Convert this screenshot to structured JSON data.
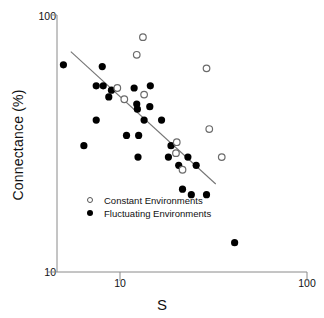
{
  "chart_data": {
    "type": "scatter",
    "title": "",
    "xlabel": "S",
    "ylabel": "Connectance (%)",
    "xscale": "log",
    "yscale": "log",
    "xlim": [
      5,
      100
    ],
    "ylim": [
      10,
      100
    ],
    "xticks": [
      "10",
      "100"
    ],
    "xtick_values": [
      10,
      100
    ],
    "yticks": [
      "100",
      "10"
    ],
    "ytick_values": [
      100,
      10
    ],
    "grid": false,
    "legend_position": "lower-left-inside",
    "legend": [
      {
        "label": "Constant Environments",
        "marker": "open-circle"
      },
      {
        "label": "Fluctuating Environments",
        "marker": "filled-circle"
      }
    ],
    "series": [
      {
        "name": "Constant Environments",
        "marker": "open-circle",
        "points": [
          {
            "x": 14.0,
            "y": 82
          },
          {
            "x": 13.0,
            "y": 70
          },
          {
            "x": 30.0,
            "y": 62
          },
          {
            "x": 10.3,
            "y": 52
          },
          {
            "x": 14.2,
            "y": 49
          },
          {
            "x": 11.2,
            "y": 47
          },
          {
            "x": 31.0,
            "y": 36
          },
          {
            "x": 21.0,
            "y": 32
          },
          {
            "x": 20.8,
            "y": 29
          },
          {
            "x": 36.0,
            "y": 28
          },
          {
            "x": 22.5,
            "y": 25
          }
        ]
      },
      {
        "name": "Fluctuating Environments",
        "marker": "filled-circle",
        "points": [
          {
            "x": 5.4,
            "y": 64
          },
          {
            "x": 8.6,
            "y": 63
          },
          {
            "x": 8.0,
            "y": 53
          },
          {
            "x": 8.7,
            "y": 53
          },
          {
            "x": 9.6,
            "y": 51
          },
          {
            "x": 9.3,
            "y": 48
          },
          {
            "x": 12.6,
            "y": 52
          },
          {
            "x": 15.3,
            "y": 53
          },
          {
            "x": 13.0,
            "y": 45
          },
          {
            "x": 13.1,
            "y": 43
          },
          {
            "x": 15.2,
            "y": 44
          },
          {
            "x": 8.0,
            "y": 39
          },
          {
            "x": 14.2,
            "y": 39
          },
          {
            "x": 17.5,
            "y": 39
          },
          {
            "x": 6.9,
            "y": 31
          },
          {
            "x": 11.5,
            "y": 34
          },
          {
            "x": 13.3,
            "y": 34
          },
          {
            "x": 19.6,
            "y": 31
          },
          {
            "x": 13.2,
            "y": 28
          },
          {
            "x": 19.0,
            "y": 28
          },
          {
            "x": 24.0,
            "y": 28
          },
          {
            "x": 21.5,
            "y": 26
          },
          {
            "x": 26.5,
            "y": 26
          },
          {
            "x": 22.5,
            "y": 21
          },
          {
            "x": 25.0,
            "y": 20
          },
          {
            "x": 30.0,
            "y": 20
          },
          {
            "x": 42.0,
            "y": 13
          }
        ]
      }
    ],
    "trendline": {
      "x1": 5.9,
      "y1": 72,
      "x2": 33.5,
      "y2": 22
    }
  },
  "axis": {
    "y_top_label": "100",
    "y_bottom_label": "10",
    "x_left_label": "10",
    "x_right_label": "100",
    "x_title": "S",
    "y_title": "Connectance (%)"
  },
  "colors": {
    "axis": "#808080",
    "marker_fill": "#000000",
    "marker_open_stroke": "#6b6b6b",
    "trendline": "#707070",
    "text": "#111111",
    "background": "#ffffff"
  }
}
